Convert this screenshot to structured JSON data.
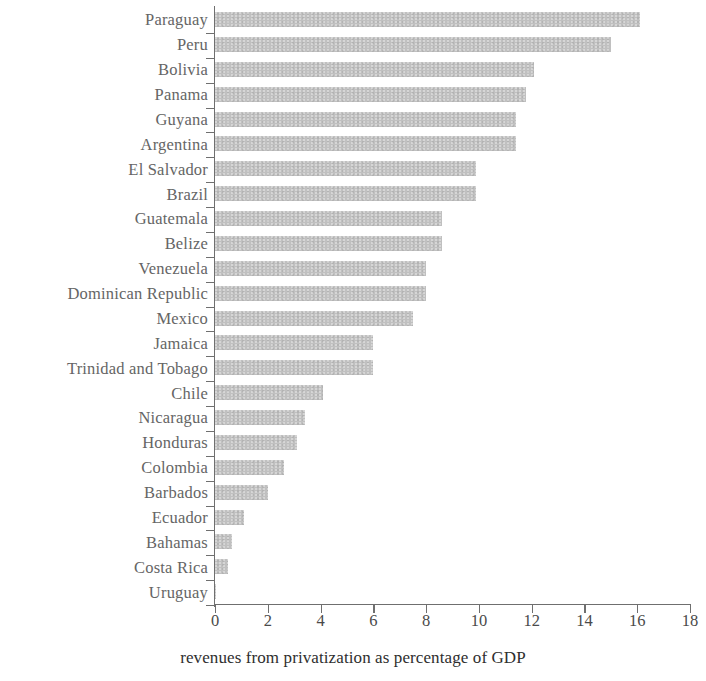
{
  "chart_data": {
    "type": "bar",
    "orientation": "horizontal",
    "title": "",
    "xlabel": "revenues from privatization as percentage of GDP",
    "ylabel": "",
    "xlim": [
      0,
      18
    ],
    "x_ticks": [
      0,
      2,
      4,
      6,
      8,
      10,
      12,
      14,
      16,
      18
    ],
    "grid": false,
    "legend": false,
    "bar_color": "#bdbdbd",
    "axis_color": "#6f6f6f",
    "label_color": "#656565",
    "categories": [
      "Paraguay",
      "Peru",
      "Bolivia",
      "Panama",
      "Guyana",
      "Argentina",
      "El Salvador",
      "Brazil",
      "Guatemala",
      "Belize",
      "Venezuela",
      "Dominican Republic",
      "Mexico",
      "Jamaica",
      "Trinidad and Tobago",
      "Chile",
      "Nicaragua",
      "Honduras",
      "Colombia",
      "Barbados",
      "Ecuador",
      "Bahamas",
      "Costa Rica",
      "Uruguay"
    ],
    "values": [
      16.1,
      15.0,
      12.1,
      11.8,
      11.4,
      11.4,
      9.9,
      9.9,
      8.6,
      8.6,
      8.0,
      8.0,
      7.5,
      6.0,
      6.0,
      4.1,
      3.4,
      3.1,
      2.6,
      2.0,
      1.1,
      0.65,
      0.5,
      0.05
    ]
  }
}
